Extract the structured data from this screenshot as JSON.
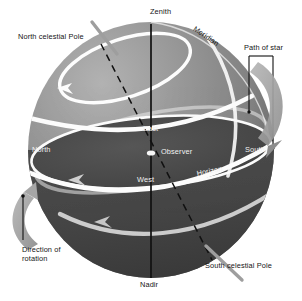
{
  "figure": {
    "colors": {
      "background": "#ffffff",
      "sphere_light": "#9a9a9a",
      "sphere_mid": "#848484",
      "sphere_dark": "#585858",
      "below_horizon": "#4a4a4a",
      "horizon_plane": "#474747",
      "path_band": "#fdfdfd",
      "leader_gray": "#9e9e9e",
      "axis_black": "#121212",
      "text": "#151515",
      "text_on_dark": "#f2f2f2"
    },
    "labels": {
      "zenith": "Zenith",
      "nadir": "Nadir",
      "meridian": "Meridian",
      "horizon": "Horizon",
      "north_celestial_pole": "North celestial Pole",
      "south_celestial_pole": "South celestial Pole",
      "path_of_star": "Path of star",
      "direction_of_rotation": "Direction of rotation",
      "observer": "Observer",
      "north": "North",
      "south": "South",
      "east": "East",
      "west": "West"
    }
  }
}
